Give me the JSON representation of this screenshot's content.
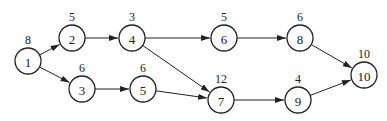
{
  "diagram": {
    "type": "directed-network",
    "nodes": [
      {
        "id": "1",
        "label": "1",
        "weight": "8",
        "x": 28,
        "y": 61
      },
      {
        "id": "2",
        "label": "2",
        "weight": "5",
        "x": 72,
        "y": 38
      },
      {
        "id": "3",
        "label": "3",
        "weight": "6",
        "x": 82,
        "y": 89
      },
      {
        "id": "4",
        "label": "4",
        "weight": "3",
        "x": 132,
        "y": 38
      },
      {
        "id": "5",
        "label": "5",
        "weight": "6",
        "x": 143,
        "y": 89
      },
      {
        "id": "6",
        "label": "6",
        "weight": "5",
        "x": 224,
        "y": 38
      },
      {
        "id": "7",
        "label": "7",
        "weight": "12",
        "x": 221,
        "y": 100
      },
      {
        "id": "8",
        "label": "8",
        "weight": "6",
        "x": 300,
        "y": 38
      },
      {
        "id": "9",
        "label": "9",
        "weight": "4",
        "x": 298,
        "y": 100
      },
      {
        "id": "10",
        "label": "10",
        "weight": "10",
        "x": 364,
        "y": 75
      }
    ],
    "edges": [
      {
        "from": "1",
        "to": "2"
      },
      {
        "from": "1",
        "to": "3"
      },
      {
        "from": "2",
        "to": "4"
      },
      {
        "from": "3",
        "to": "5"
      },
      {
        "from": "4",
        "to": "6"
      },
      {
        "from": "4",
        "to": "7"
      },
      {
        "from": "5",
        "to": "7"
      },
      {
        "from": "6",
        "to": "8"
      },
      {
        "from": "7",
        "to": "9"
      },
      {
        "from": "8",
        "to": "10"
      },
      {
        "from": "9",
        "to": "10"
      }
    ],
    "style": {
      "stroke_color": "#222222",
      "background": "#ffffff",
      "node_radius": 13
    }
  }
}
